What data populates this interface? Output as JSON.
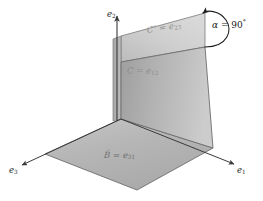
{
  "figure": {
    "title": "",
    "background_color": "#ffffff",
    "axes": [
      {
        "name": "e1",
        "label_main": "e",
        "label_sub": "1",
        "position": "bottom-right"
      },
      {
        "name": "e2",
        "label_main": "e",
        "label_sub": "2",
        "position": "top-center"
      },
      {
        "name": "e3",
        "label_main": "e",
        "label_sub": "3",
        "position": "bottom-left"
      }
    ],
    "planes": [
      {
        "name": "horizontal-plane",
        "label_lhs": "B̂",
        "label_eq": " = ",
        "label_main": "e",
        "label_sub": "31",
        "fill_color": "#b9b9b9",
        "orientation": "horizontal"
      },
      {
        "name": "front-vertical-plane",
        "label_lhs": "C",
        "label_eq": " = ",
        "label_main": "e",
        "label_sub": "12",
        "fill_color": "#b0b0b0",
        "orientation": "vertical-front"
      },
      {
        "name": "back-vertical-plane",
        "label_lhs": "C″",
        "label_eq": " = ",
        "label_main": "e",
        "label_sub": "23",
        "fill_color": "#c9c9c9",
        "orientation": "vertical-back"
      }
    ],
    "annotation": {
      "name": "angle-annotation",
      "symbol": "α",
      "equals": " = ",
      "value": "90",
      "unit": "°",
      "arc_direction": "clockwise-loop",
      "arrow_at": "top"
    },
    "colors": {
      "line": "#3a3a3a",
      "text": "#1f1f1f",
      "faded_text": "#878787",
      "plane_light": "#d2d2d2",
      "plane_mid": "#b8b8b8",
      "plane_dark": "#a3a3a3"
    }
  }
}
